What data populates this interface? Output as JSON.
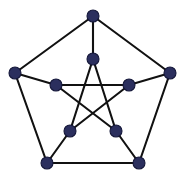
{
  "figure": {
    "name": "petersen-graph",
    "background_color": "#ffffff",
    "width": 185,
    "height": 178
  },
  "style": {
    "vertex_fill": "#2b2f5e",
    "vertex_stroke": "#15183a",
    "vertex_radius": 6,
    "edge_color": "#111111",
    "edge_width": 2.1
  },
  "graph": {
    "type": "undirected-graph",
    "vertex_count": 10,
    "edge_count": 15,
    "degree": 3,
    "vertices": [
      {
        "id": "outer-top",
        "ring": "outer",
        "x": 93,
        "y": 16
      },
      {
        "id": "outer-right",
        "ring": "outer",
        "x": 170,
        "y": 73
      },
      {
        "id": "outer-bottom-right",
        "ring": "outer",
        "x": 139,
        "y": 163
      },
      {
        "id": "outer-bottom-left",
        "ring": "outer",
        "x": 47,
        "y": 163
      },
      {
        "id": "outer-left",
        "ring": "outer",
        "x": 15,
        "y": 73
      },
      {
        "id": "inner-top",
        "ring": "inner",
        "x": 93,
        "y": 59
      },
      {
        "id": "inner-right",
        "ring": "inner",
        "x": 129,
        "y": 85
      },
      {
        "id": "inner-bottom-right",
        "ring": "inner",
        "x": 116,
        "y": 131
      },
      {
        "id": "inner-bottom-left",
        "ring": "inner",
        "x": 70,
        "y": 131
      },
      {
        "id": "inner-left",
        "ring": "inner",
        "x": 56,
        "y": 85
      }
    ],
    "edges": [
      {
        "id": "pentagon-top-right",
        "group": "outer-cycle",
        "from": "outer-top",
        "to": "outer-right"
      },
      {
        "id": "pentagon-right-bottomright",
        "group": "outer-cycle",
        "from": "outer-right",
        "to": "outer-bottom-right"
      },
      {
        "id": "pentagon-bottom",
        "group": "outer-cycle",
        "from": "outer-bottom-right",
        "to": "outer-bottom-left"
      },
      {
        "id": "pentagon-bottomleft-left",
        "group": "outer-cycle",
        "from": "outer-bottom-left",
        "to": "outer-left"
      },
      {
        "id": "pentagon-left-top",
        "group": "outer-cycle",
        "from": "outer-left",
        "to": "outer-top"
      },
      {
        "id": "spoke-top",
        "group": "spokes",
        "from": "outer-top",
        "to": "inner-top"
      },
      {
        "id": "spoke-right",
        "group": "spokes",
        "from": "outer-right",
        "to": "inner-right"
      },
      {
        "id": "spoke-bottom-right",
        "group": "spokes",
        "from": "outer-bottom-right",
        "to": "inner-bottom-right"
      },
      {
        "id": "spoke-bottom-left",
        "group": "spokes",
        "from": "outer-bottom-left",
        "to": "inner-bottom-left"
      },
      {
        "id": "spoke-left",
        "group": "spokes",
        "from": "outer-left",
        "to": "inner-left"
      },
      {
        "id": "pentagram-top-bottomright",
        "group": "inner-pentagram",
        "from": "inner-top",
        "to": "inner-bottom-right"
      },
      {
        "id": "pentagram-bottomright-left",
        "group": "inner-pentagram",
        "from": "inner-bottom-right",
        "to": "inner-left"
      },
      {
        "id": "pentagram-left-right",
        "group": "inner-pentagram",
        "from": "inner-left",
        "to": "inner-right"
      },
      {
        "id": "pentagram-right-bottomleft",
        "group": "inner-pentagram",
        "from": "inner-right",
        "to": "inner-bottom-left"
      },
      {
        "id": "pentagram-bottomleft-top",
        "group": "inner-pentagram",
        "from": "inner-bottom-left",
        "to": "inner-top"
      }
    ]
  }
}
